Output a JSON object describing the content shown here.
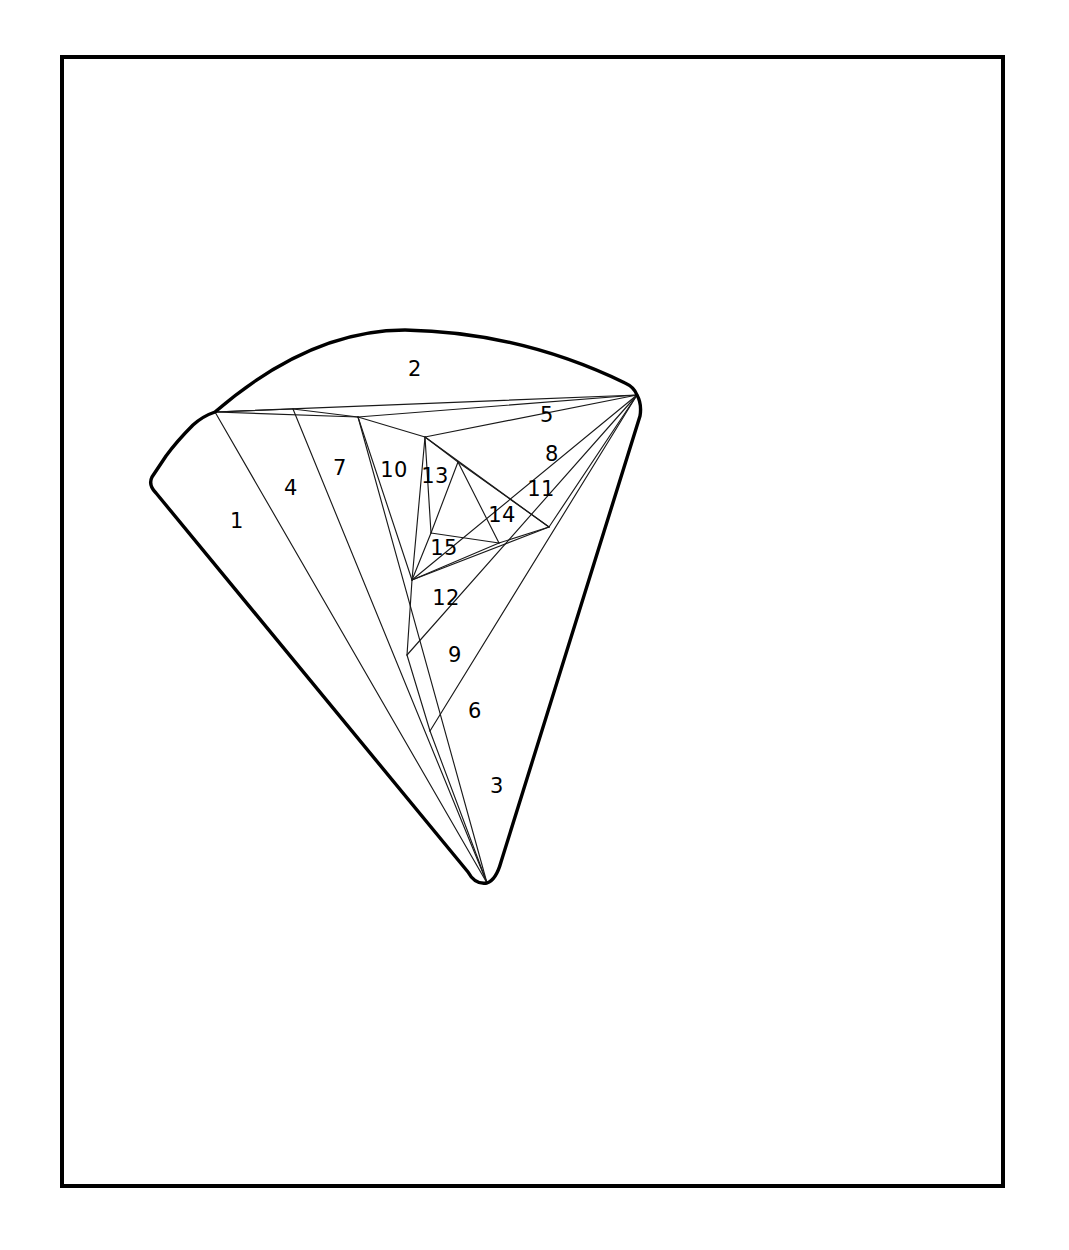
{
  "figure": {
    "background_color": "#ffffff",
    "line_color": "#000000",
    "label_color": "#000000",
    "frame": {
      "x": 60,
      "y": 55,
      "width": 945,
      "height": 1133,
      "stroke_width": 4
    },
    "outline": {
      "stroke_width": 3.4,
      "description": "rounded-corner circular sector fan shape"
    },
    "chord_stroke_width": 1.15
  },
  "geometry": {
    "vertices": {
      "apex": [
        487,
        883
      ],
      "left_corner": [
        152,
        477
      ],
      "arc_left": [
        215,
        412
      ],
      "arc_peak": [
        405,
        330
      ],
      "right_corner": [
        637,
        395
      ],
      "hub_a": [
        293,
        409
      ],
      "hub_b": [
        358,
        417
      ],
      "hub_c": [
        425,
        437
      ],
      "hub_d": [
        458,
        462
      ],
      "hub_e": [
        549,
        527
      ],
      "hub_f": [
        499,
        543
      ],
      "hub_g": [
        431,
        533
      ],
      "hub_h": [
        412,
        580
      ],
      "hub_i": [
        407,
        655
      ],
      "hub_j": [
        430,
        731
      ]
    }
  },
  "chart_data": {
    "type": "diagram",
    "subtype": "polygon triangulation",
    "region_count": 15,
    "regions": [
      {
        "id": 1,
        "label": "1",
        "label_x": 237,
        "label_y": 522,
        "polygon": [
          [
            215,
            412
          ],
          [
            152,
            477
          ],
          [
            487,
            883
          ]
        ]
      },
      {
        "id": 2,
        "label": "2",
        "label_x": 415,
        "label_y": 370,
        "polygon": [
          [
            215,
            412
          ],
          [
            405,
            330
          ],
          [
            637,
            395
          ]
        ]
      },
      {
        "id": 3,
        "label": "3",
        "label_x": 497,
        "label_y": 787,
        "polygon": [
          [
            487,
            883
          ],
          [
            430,
            731
          ],
          [
            637,
            395
          ]
        ]
      },
      {
        "id": 4,
        "label": "4",
        "label_x": 291,
        "label_y": 489,
        "polygon": [
          [
            215,
            412
          ],
          [
            293,
            409
          ],
          [
            487,
            883
          ]
        ]
      },
      {
        "id": 5,
        "label": "5",
        "label_x": 547,
        "label_y": 416,
        "polygon": [
          [
            215,
            412
          ],
          [
            637,
            395
          ],
          [
            358,
            417
          ]
        ]
      },
      {
        "id": 6,
        "label": "6",
        "label_x": 475,
        "label_y": 712,
        "polygon": [
          [
            430,
            731
          ],
          [
            407,
            655
          ],
          [
            637,
            395
          ]
        ]
      },
      {
        "id": 7,
        "label": "7",
        "label_x": 340,
        "label_y": 469,
        "polygon": [
          [
            293,
            409
          ],
          [
            358,
            417
          ],
          [
            487,
            883
          ]
        ]
      },
      {
        "id": 8,
        "label": "8",
        "label_x": 552,
        "label_y": 455,
        "polygon": [
          [
            358,
            417
          ],
          [
            637,
            395
          ],
          [
            425,
            437
          ]
        ]
      },
      {
        "id": 9,
        "label": "9",
        "label_x": 455,
        "label_y": 656,
        "polygon": [
          [
            407,
            655
          ],
          [
            412,
            580
          ],
          [
            637,
            395
          ]
        ]
      },
      {
        "id": 10,
        "label": "10",
        "label_x": 394,
        "label_y": 471,
        "polygon": [
          [
            358,
            417
          ],
          [
            425,
            437
          ],
          [
            412,
            580
          ]
        ]
      },
      {
        "id": 11,
        "label": "11",
        "label_x": 541,
        "label_y": 490,
        "polygon": [
          [
            425,
            437
          ],
          [
            637,
            395
          ],
          [
            549,
            527
          ]
        ]
      },
      {
        "id": 12,
        "label": "12",
        "label_x": 446,
        "label_y": 599,
        "polygon": [
          [
            412,
            580
          ],
          [
            549,
            527
          ],
          [
            637,
            395
          ]
        ]
      },
      {
        "id": 13,
        "label": "13",
        "label_x": 435,
        "label_y": 477,
        "polygon": [
          [
            425,
            437
          ],
          [
            458,
            462
          ],
          [
            431,
            533
          ]
        ]
      },
      {
        "id": 14,
        "label": "14",
        "label_x": 502,
        "label_y": 516,
        "polygon": [
          [
            458,
            462
          ],
          [
            549,
            527
          ],
          [
            499,
            543
          ]
        ]
      },
      {
        "id": 15,
        "label": "15",
        "label_x": 444,
        "label_y": 549,
        "polygon": [
          [
            431,
            533
          ],
          [
            499,
            543
          ],
          [
            412,
            580
          ]
        ]
      }
    ],
    "labels": [
      "1",
      "2",
      "3",
      "4",
      "5",
      "6",
      "7",
      "8",
      "9",
      "10",
      "11",
      "12",
      "13",
      "14",
      "15"
    ]
  }
}
